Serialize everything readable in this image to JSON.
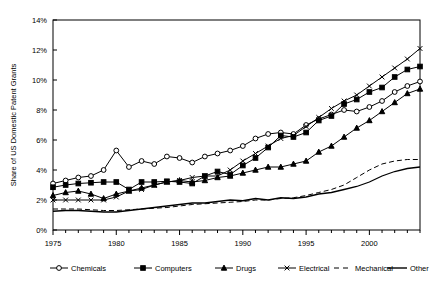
{
  "chart_data": {
    "type": "line",
    "title": "",
    "xlabel": "",
    "ylabel": "Share of US Domestic Patent Grants",
    "xlim": [
      1975,
      2004
    ],
    "ylim": [
      0,
      14
    ],
    "ytick_labels": [
      "0%",
      "2%",
      "4%",
      "6%",
      "8%",
      "10%",
      "12%",
      "14%"
    ],
    "ytick_values": [
      0,
      2,
      4,
      6,
      8,
      10,
      12,
      14
    ],
    "xtick_labels": [
      "1975",
      "1980",
      "1985",
      "1990",
      "1995",
      "2000"
    ],
    "xtick_values": [
      1975,
      1980,
      1985,
      1990,
      1995,
      2000
    ],
    "grid": false,
    "legend_position": "bottom",
    "x": [
      1975,
      1976,
      1977,
      1978,
      1979,
      1980,
      1981,
      1982,
      1983,
      1984,
      1985,
      1986,
      1987,
      1988,
      1989,
      1990,
      1991,
      1992,
      1993,
      1994,
      1995,
      1996,
      1997,
      1998,
      1999,
      2000,
      2001,
      2002,
      2003,
      2004
    ],
    "series": [
      {
        "name": "Chemicals",
        "marker": "open-circle",
        "style": "solid",
        "values": [
          3.1,
          3.3,
          3.5,
          3.6,
          4.0,
          5.3,
          4.2,
          4.6,
          4.4,
          4.9,
          4.8,
          4.5,
          4.9,
          5.1,
          5.3,
          5.6,
          6.1,
          6.4,
          6.5,
          6.4,
          7.0,
          7.4,
          7.7,
          8.0,
          7.9,
          8.2,
          8.6,
          9.2,
          9.6,
          9.9
        ]
      },
      {
        "name": "Computers",
        "marker": "filled-square",
        "style": "solid",
        "values": [
          2.85,
          3.0,
          3.1,
          3.15,
          3.2,
          3.2,
          2.7,
          3.2,
          3.2,
          3.25,
          3.2,
          3.1,
          3.6,
          3.9,
          3.7,
          4.3,
          4.8,
          5.5,
          6.3,
          6.2,
          6.5,
          7.3,
          7.6,
          8.4,
          8.7,
          9.2,
          9.5,
          10.2,
          10.7,
          10.9
        ]
      },
      {
        "name": "Drugs",
        "marker": "filled-triangle",
        "style": "solid",
        "values": [
          2.3,
          2.5,
          2.6,
          2.4,
          2.1,
          2.4,
          2.6,
          2.8,
          3.0,
          3.2,
          3.3,
          3.2,
          3.3,
          3.5,
          3.6,
          3.8,
          4.0,
          4.2,
          4.2,
          4.4,
          4.6,
          5.2,
          5.6,
          6.2,
          6.8,
          7.3,
          7.9,
          8.5,
          9.1,
          9.4
        ]
      },
      {
        "name": "Electrical",
        "marker": "x",
        "style": "solid",
        "values": [
          2.0,
          2.0,
          2.0,
          2.0,
          2.0,
          2.2,
          2.6,
          2.7,
          3.0,
          3.2,
          3.3,
          3.5,
          3.6,
          3.6,
          4.0,
          4.6,
          5.1,
          5.6,
          6.1,
          6.3,
          6.9,
          7.5,
          8.1,
          8.6,
          9.0,
          9.6,
          10.2,
          10.8,
          11.4,
          12.1
        ]
      },
      {
        "name": "Mechanical",
        "marker": "none",
        "style": "dashed",
        "values": [
          1.4,
          1.4,
          1.4,
          1.35,
          1.3,
          1.3,
          1.35,
          1.4,
          1.45,
          1.5,
          1.6,
          1.7,
          1.75,
          1.8,
          1.85,
          1.9,
          2.0,
          2.0,
          2.1,
          2.15,
          2.3,
          2.5,
          2.7,
          3.0,
          3.5,
          4.0,
          4.4,
          4.6,
          4.7,
          4.7
        ]
      },
      {
        "name": "Other",
        "marker": "none",
        "style": "solid-thick",
        "values": [
          1.25,
          1.3,
          1.3,
          1.25,
          1.2,
          1.2,
          1.3,
          1.4,
          1.5,
          1.6,
          1.7,
          1.8,
          1.8,
          1.9,
          2.0,
          1.95,
          2.1,
          2.0,
          2.15,
          2.1,
          2.2,
          2.4,
          2.5,
          2.7,
          2.9,
          3.2,
          3.6,
          3.9,
          4.1,
          4.2
        ]
      }
    ]
  }
}
